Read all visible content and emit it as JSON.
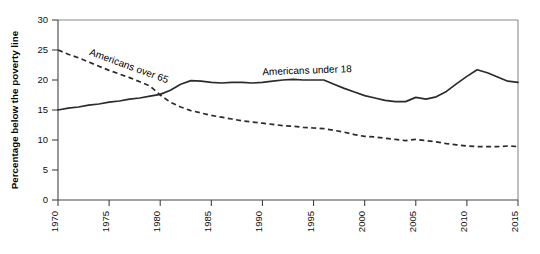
{
  "chart_data": {
    "type": "line",
    "title": "",
    "subtitle": "",
    "xlabel": "",
    "ylabel": "Percentage below the poverty line",
    "xlim": [
      1970,
      2015
    ],
    "ylim": [
      0,
      30
    ],
    "grid": false,
    "legend_position": "inline-annotations",
    "xticks": [
      "1970",
      "1975",
      "1980",
      "1985",
      "1990",
      "1995",
      "2000",
      "2005",
      "2010",
      "2015"
    ],
    "xtick_values": [
      1970,
      1975,
      1980,
      1985,
      1990,
      1995,
      2000,
      2005,
      2010,
      2015
    ],
    "yticks": [
      "0",
      "5",
      "10",
      "15",
      "20",
      "25",
      "30"
    ],
    "ytick_values": [
      0,
      5,
      10,
      15,
      20,
      25,
      30
    ],
    "x": [
      1970,
      1971,
      1972,
      1973,
      1974,
      1975,
      1976,
      1977,
      1978,
      1979,
      1980,
      1981,
      1982,
      1983,
      1984,
      1985,
      1986,
      1987,
      1988,
      1989,
      1990,
      1991,
      1992,
      1993,
      1994,
      1995,
      1996,
      1997,
      1998,
      1999,
      2000,
      2001,
      2002,
      2003,
      2004,
      2005,
      2006,
      2007,
      2008,
      2009,
      2010,
      2011,
      2012,
      2013,
      2014,
      2015
    ],
    "series": [
      {
        "name": "Americans under 18",
        "style": "solid",
        "color": "#2b2b2b",
        "label_x": 1990,
        "label_y": 20.8,
        "label_rotation": -2,
        "values": [
          15.0,
          15.3,
          15.5,
          15.8,
          16.0,
          16.3,
          16.5,
          16.8,
          17.0,
          17.3,
          17.6,
          18.3,
          19.3,
          19.9,
          19.8,
          19.6,
          19.5,
          19.6,
          19.6,
          19.5,
          19.6,
          19.8,
          20.0,
          20.1,
          20.0,
          20.0,
          20.0,
          19.3,
          18.6,
          18.0,
          17.4,
          17.0,
          16.6,
          16.4,
          16.4,
          17.1,
          16.8,
          17.2,
          18.1,
          19.4,
          20.6,
          21.7,
          21.2,
          20.5,
          19.8,
          19.6
        ]
      },
      {
        "name": "Americans over 65",
        "style": "dashed",
        "color": "#2b2b2b",
        "label_x": 1973,
        "label_y": 24.2,
        "label_rotation": 20,
        "values": [
          25.0,
          24.3,
          23.7,
          23.0,
          22.3,
          21.6,
          21.0,
          20.4,
          19.7,
          19.0,
          17.5,
          16.3,
          15.5,
          14.9,
          14.5,
          14.1,
          13.8,
          13.5,
          13.2,
          13.0,
          12.8,
          12.6,
          12.4,
          12.3,
          12.1,
          12.0,
          11.9,
          11.6,
          11.3,
          10.9,
          10.6,
          10.5,
          10.3,
          10.1,
          9.9,
          10.1,
          9.9,
          9.7,
          9.4,
          9.2,
          9.0,
          8.9,
          8.9,
          8.9,
          9.0,
          8.9
        ]
      }
    ]
  },
  "axis": {
    "ylabel": "Percentage below the poverty line"
  }
}
